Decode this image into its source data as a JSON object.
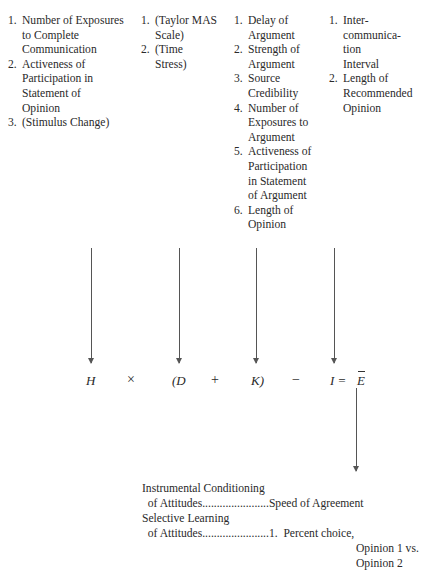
{
  "columns": [
    {
      "items": [
        {
          "num": "1.",
          "lines": [
            "Number of Exposures",
            "to Complete",
            "Communication"
          ]
        },
        {
          "num": "2.",
          "lines": [
            "Activeness of",
            "Participation in",
            "Statement of",
            "Opinion"
          ]
        },
        {
          "num": "3.",
          "lines": [
            "(Stimulus Change)"
          ]
        }
      ]
    },
    {
      "items": [
        {
          "num": "1.",
          "lines": [
            "(Taylor MAS",
            "Scale)"
          ]
        },
        {
          "num": "2.",
          "lines": [
            "(Time",
            "Stress)"
          ]
        }
      ]
    },
    {
      "items": [
        {
          "num": "1.",
          "lines": [
            "Delay of",
            "Argument"
          ]
        },
        {
          "num": "2.",
          "lines": [
            "Strength of",
            "Argument"
          ]
        },
        {
          "num": "3.",
          "lines": [
            "Source",
            "Credibility"
          ]
        },
        {
          "num": "4.",
          "lines": [
            "Number of",
            "Exposures to",
            "Argument"
          ]
        },
        {
          "num": "5.",
          "lines": [
            "Activeness of",
            "Participation",
            "in Statement",
            "of Argument"
          ]
        },
        {
          "num": "6.",
          "lines": [
            "Length of",
            "Opinion"
          ]
        }
      ]
    },
    {
      "items": [
        {
          "num": "1.",
          "lines": [
            "Inter-",
            "communica-",
            "tion",
            "Interval"
          ]
        },
        {
          "num": "2.",
          "lines": [
            "Length of",
            "Recommended",
            "Opinion"
          ]
        }
      ]
    }
  ],
  "equation": {
    "H": "H",
    "times": "×",
    "open_paren_D": "(D",
    "plus": "+",
    "K_close_paren": "K)",
    "minus": "−",
    "I_equals": "I =",
    "E": "E"
  },
  "outputs": {
    "line1": "Instrumental Conditioning",
    "line2": "  of Attitudes.......................Speed of Agreement",
    "line3": "Selective Learning",
    "line4": "  of Attitudes.......................1.  Percent choice,",
    "line5": "Opinion 1 vs.",
    "line6": "Opinion 2"
  }
}
